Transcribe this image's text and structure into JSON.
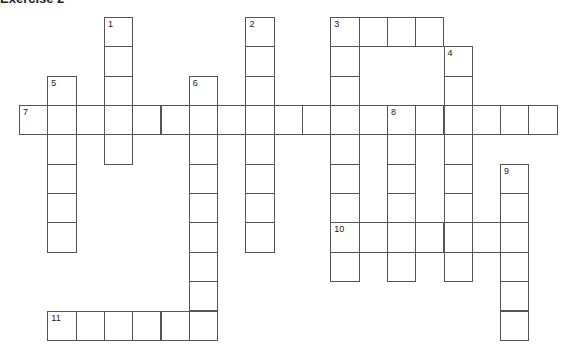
{
  "heading": "Exercise 2",
  "grid": {
    "origin_x": 19,
    "origin_y": 17,
    "cell_w": 28.3,
    "cell_h": 29.35,
    "line_color": "#555555"
  },
  "clues": [
    {
      "number": "1",
      "direction": "down",
      "col": 3,
      "row": 0,
      "length": 5
    },
    {
      "number": "2",
      "direction": "down",
      "col": 8,
      "row": 0,
      "length": 8
    },
    {
      "number": "3",
      "direction": "across",
      "col": 11,
      "row": 0,
      "length": 4
    },
    {
      "number": "3",
      "direction": "down",
      "col": 11,
      "row": 0,
      "length": 9
    },
    {
      "number": "4",
      "direction": "down",
      "col": 15,
      "row": 1,
      "length": 8
    },
    {
      "number": "5",
      "direction": "down",
      "col": 1,
      "row": 2,
      "length": 6
    },
    {
      "number": "6",
      "direction": "down",
      "col": 6,
      "row": 2,
      "length": 9
    },
    {
      "number": "7",
      "direction": "across",
      "col": 0,
      "row": 3,
      "length": 19
    },
    {
      "number": "8",
      "direction": "down",
      "col": 13,
      "row": 3,
      "length": 6
    },
    {
      "number": "9",
      "direction": "down",
      "col": 17,
      "row": 5,
      "length": 6
    },
    {
      "number": "10",
      "direction": "across",
      "col": 11,
      "row": 7,
      "length": 7
    },
    {
      "number": "11",
      "direction": "across",
      "col": 1,
      "row": 10,
      "length": 6
    }
  ]
}
